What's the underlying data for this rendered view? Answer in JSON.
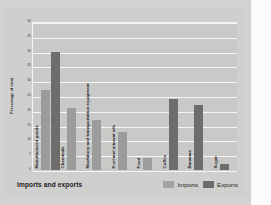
{
  "figure": {
    "title": "Imports and exports",
    "legend": [
      {
        "label": "Imports",
        "color": "#a3a3a1"
      },
      {
        "label": "Exports",
        "color": "#6d6d6b"
      }
    ]
  },
  "chart_data": {
    "type": "bar",
    "title": "Imports and exports",
    "xlabel": "",
    "ylabel": "Percentage of total",
    "ylim": [
      0,
      50
    ],
    "yticks": [
      0,
      5,
      10,
      15,
      20,
      25,
      30,
      35,
      40,
      45,
      50
    ],
    "grid": true,
    "legend_position": "bottom-right",
    "categories": [
      "Manufactured goods",
      "Chemicals",
      "Machinery and transportation equipment",
      "Fuel and mineral oils",
      "Food",
      "Coffee",
      "Bananas",
      "Sugar"
    ],
    "series": [
      {
        "name": "Imports",
        "color": "#9c9c9a",
        "values": [
          27,
          21,
          17,
          13,
          4,
          null,
          null,
          null
        ]
      },
      {
        "name": "Exports",
        "color": "#6d6d6b",
        "values": [
          40,
          null,
          null,
          null,
          null,
          24,
          22,
          2
        ]
      }
    ]
  },
  "right_panel": {
    "rules": 3,
    "visible": true
  }
}
